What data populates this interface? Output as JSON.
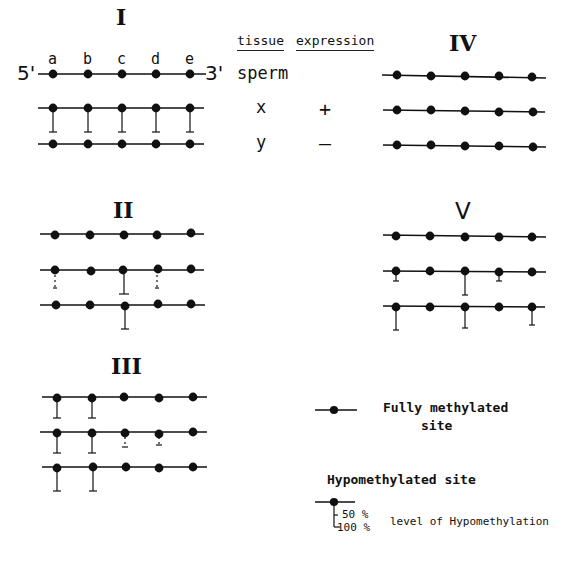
{
  "header": {
    "tissue_label": "tissue",
    "expression_label": "expression"
  },
  "site_labels": [
    "a",
    "b",
    "c",
    "d",
    "e"
  ],
  "ends": {
    "five_prime": "5'",
    "three_prime": "3'"
  },
  "tissues": [
    {
      "name": "sperm",
      "expression": ""
    },
    {
      "name": "x",
      "expression": "+"
    },
    {
      "name": "y",
      "expression": "–"
    }
  ],
  "panels": [
    {
      "id": "I",
      "label": "I",
      "rows": [
        {
          "tissue": "sperm",
          "hypo": [
            0,
            0,
            0,
            0,
            0
          ]
        },
        {
          "tissue": "x",
          "hypo": [
            100,
            100,
            100,
            100,
            100
          ]
        },
        {
          "tissue": "y",
          "hypo": [
            0,
            0,
            0,
            0,
            0
          ]
        }
      ]
    },
    {
      "id": "II",
      "label": "II",
      "rows": [
        {
          "tissue": "sperm",
          "hypo": [
            0,
            0,
            0,
            0,
            0
          ]
        },
        {
          "tissue": "x",
          "hypo": [
            "partial",
            0,
            100,
            "partial",
            0
          ]
        },
        {
          "tissue": "y",
          "hypo": [
            0,
            0,
            100,
            0,
            0
          ]
        }
      ]
    },
    {
      "id": "III",
      "label": "III",
      "rows": [
        {
          "tissue": "sperm",
          "hypo": [
            100,
            100,
            0,
            0,
            0
          ]
        },
        {
          "tissue": "x",
          "hypo": [
            100,
            100,
            "partial",
            "partial",
            0
          ]
        },
        {
          "tissue": "y",
          "hypo": [
            100,
            100,
            0,
            0,
            0
          ]
        }
      ]
    },
    {
      "id": "IV",
      "label": "IV",
      "rows": [
        {
          "tissue": "sperm",
          "hypo": [
            0,
            0,
            0,
            0,
            0
          ]
        },
        {
          "tissue": "x",
          "hypo": [
            0,
            0,
            0,
            0,
            0
          ]
        },
        {
          "tissue": "y",
          "hypo": [
            0,
            0,
            0,
            0,
            0
          ]
        }
      ]
    },
    {
      "id": "V",
      "label": "V",
      "rows": [
        {
          "tissue": "sperm",
          "hypo": [
            0,
            0,
            0,
            0,
            0
          ]
        },
        {
          "tissue": "x",
          "hypo": [
            25,
            0,
            60,
            25,
            0
          ]
        },
        {
          "tissue": "y",
          "hypo": [
            60,
            0,
            60,
            50,
            0
          ]
        }
      ]
    }
  ],
  "legend": {
    "full_line1": "Fully  methylated",
    "full_line2": "site",
    "hypo_title": "Hypomethylated site",
    "pct50": "50 %",
    "pct100": "100 %",
    "level_text": "level of Hypomethylation"
  }
}
